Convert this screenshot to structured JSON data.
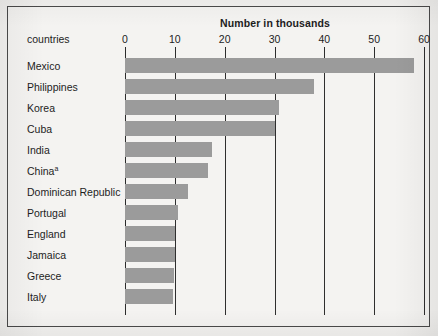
{
  "figure": {
    "row_header": "countries",
    "border_color": "#4a4a4a",
    "background_color": "#f2f1ef",
    "bar_color": "#9b9b9b",
    "footnote_marker": "a"
  },
  "chart_data": {
    "type": "bar",
    "orientation": "horizontal",
    "title": "Number in thousands",
    "xlabel": "Number in thousands",
    "ylabel": "countries",
    "xlim": [
      0,
      60
    ],
    "xticks": [
      0,
      10,
      20,
      30,
      40,
      50,
      60
    ],
    "xtick_labels": [
      "0",
      "10",
      "20",
      "30",
      "40",
      "50",
      "60"
    ],
    "grid": true,
    "legend": false,
    "categories": [
      "Mexico",
      "Philippines",
      "Korea",
      "Cuba",
      "India",
      "China",
      "Dominican Republic",
      "Portugal",
      "England",
      "Jamaica",
      "Greece",
      "Italy"
    ],
    "category_labels": [
      "Mexico",
      "Philippines",
      "Korea",
      "Cuba",
      "India",
      "Chinaᵃ",
      "Dominican Republic",
      "Portugal",
      "England",
      "Jamaica",
      "Greece",
      "Italy"
    ],
    "values": [
      58.0,
      38.0,
      31.0,
      30.0,
      17.5,
      16.7,
      12.7,
      10.7,
      10.0,
      10.0,
      9.8,
      9.7
    ],
    "units": "thousands"
  }
}
